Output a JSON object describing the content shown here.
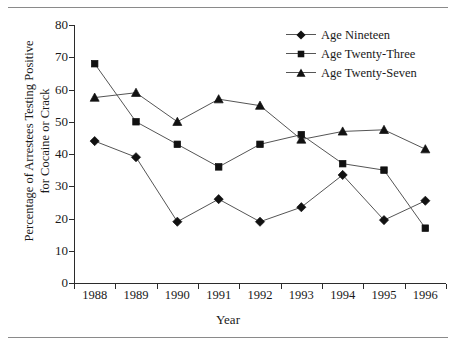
{
  "figure": {
    "has_top_rule": true,
    "has_bottom_rule": true,
    "line_color": "#555555",
    "marker_color": "#111111",
    "axis_color": "#2b2b2b",
    "text_color": "#1a1a1a",
    "background": "#ffffff"
  },
  "axis": {
    "ylabel_line1": "Percentage of Arrestees Testing Positive",
    "ylabel_line2": "for Cocaine or Crack",
    "xlabel": "Year",
    "yticks": [
      0,
      10,
      20,
      30,
      40,
      50,
      60,
      70,
      80
    ],
    "ytick_labels": [
      "0",
      "10",
      "20",
      "30",
      "40",
      "50",
      "60",
      "70",
      "80"
    ]
  },
  "legend": {
    "items": [
      {
        "label": "Age Nineteen",
        "marker": "diamond-marker"
      },
      {
        "label": "Age Twenty-Three",
        "marker": "square-marker"
      },
      {
        "label": "Age Twenty-Seven",
        "marker": "triangle-marker"
      }
    ]
  },
  "chart_data": {
    "type": "line",
    "title": "",
    "xlabel": "Year",
    "ylabel": "Percentage of Arrestees Testing Positive for Cocaine or Crack",
    "categories": [
      "1988",
      "1989",
      "1990",
      "1991",
      "1992",
      "1993",
      "1994",
      "1995",
      "1996"
    ],
    "x": [
      1988,
      1989,
      1990,
      1991,
      1992,
      1993,
      1994,
      1995,
      1996
    ],
    "ylim": [
      0,
      80
    ],
    "ytick_step": 10,
    "grid": false,
    "legend_position": "top-right",
    "series": [
      {
        "name": "Age Nineteen",
        "marker": "diamond",
        "values": [
          44,
          39,
          19,
          26,
          19,
          23.5,
          33.5,
          19.5,
          25.5
        ]
      },
      {
        "name": "Age Twenty-Three",
        "marker": "square",
        "values": [
          68,
          50,
          43,
          36,
          43,
          46,
          37,
          35,
          17
        ]
      },
      {
        "name": "Age Twenty-Seven",
        "marker": "triangle",
        "values": [
          57.5,
          59,
          50,
          57,
          55,
          44.5,
          47,
          47.5,
          41.5
        ]
      }
    ]
  }
}
